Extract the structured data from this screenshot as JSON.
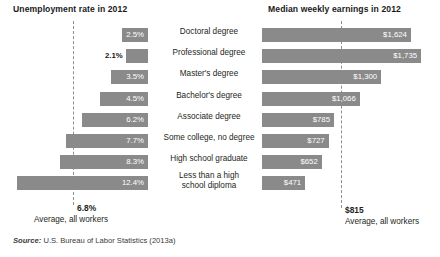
{
  "chart_data": {
    "type": "bar",
    "orientation": "horizontal",
    "layout": "paired-butterfly",
    "grid": false,
    "legend": null,
    "categories": [
      "Doctoral degree",
      "Professional degree",
      "Master's degree",
      "Bachelor's degree",
      "Associate degree",
      "Some college, no degree",
      "High school graduate",
      "Less than a high school diploma"
    ],
    "panels": [
      {
        "id": "unemployment",
        "title": "Unemployment rate in 2012",
        "xlabel": "",
        "ylabel": "",
        "unit": "percent",
        "direction": "left",
        "values": [
          2.5,
          2.1,
          3.5,
          4.5,
          6.2,
          7.7,
          8.3,
          12.4
        ],
        "value_labels": [
          "2.5%",
          "2.1%",
          "3.5%",
          "4.5%",
          "6.2%",
          "7.7%",
          "8.3%",
          "12.4%"
        ],
        "label_placement": [
          "inside",
          "outside",
          "inside",
          "inside",
          "inside",
          "inside",
          "inside",
          "inside"
        ],
        "reference_line": {
          "value": 6.8,
          "label": "6.8%",
          "caption": "Average, all workers"
        },
        "xlim": [
          0,
          14
        ]
      },
      {
        "id": "earnings",
        "title": "Median weekly earnings in 2012",
        "xlabel": "",
        "ylabel": "",
        "unit": "US dollars per week",
        "direction": "right",
        "values": [
          1624,
          1735,
          1300,
          1066,
          785,
          727,
          652,
          471
        ],
        "value_labels": [
          "$1,624",
          "$1,735",
          "$1,300",
          "$1,066",
          "$785",
          "$727",
          "$652",
          "$471"
        ],
        "label_placement": [
          "inside",
          "inside",
          "inside",
          "inside",
          "inside",
          "inside",
          "inside",
          "inside"
        ],
        "reference_line": {
          "value": 815,
          "label": "$815",
          "caption": "Average, all workers"
        },
        "xlim": [
          0,
          1900
        ]
      }
    ],
    "colors": {
      "bar": "#8a8a8a",
      "bar_label": "#ffffff",
      "text": "#231f20",
      "reference_line": "#8f8f8f"
    }
  },
  "left_panel": {
    "title": "Unemployment rate in 2012",
    "rows": [
      {
        "label": "2.5%"
      },
      {
        "label": "2.1%"
      },
      {
        "label": "3.5%"
      },
      {
        "label": "4.5%"
      },
      {
        "label": "6.2%"
      },
      {
        "label": "7.7%"
      },
      {
        "label": "8.3%"
      },
      {
        "label": "12.4%"
      }
    ],
    "average_value": "6.8%",
    "average_caption": "Average, all workers"
  },
  "right_panel": {
    "title": "Median weekly earnings in 2012",
    "rows": [
      {
        "label": "$1,624"
      },
      {
        "label": "$1,735"
      },
      {
        "label": "$1,300"
      },
      {
        "label": "$1,066"
      },
      {
        "label": "$785"
      },
      {
        "label": "$727"
      },
      {
        "label": "$652"
      },
      {
        "label": "$471"
      }
    ],
    "average_value": "$815",
    "average_caption": "Average, all workers"
  },
  "categories": [
    {
      "line1": "Doctoral degree",
      "line2": ""
    },
    {
      "line1": "Professional degree",
      "line2": ""
    },
    {
      "line1": "Master's degree",
      "line2": ""
    },
    {
      "line1": "Bachelor's degree",
      "line2": ""
    },
    {
      "line1": "Associate degree",
      "line2": ""
    },
    {
      "line1": "Some college, no degree",
      "line2": ""
    },
    {
      "line1": "High school graduate",
      "line2": ""
    },
    {
      "line1": "Less than a high school diploma",
      "line2": ""
    }
  ],
  "source": {
    "prefix": "Source:",
    "text": "U.S. Bureau of Labor Statistics (2013a)"
  }
}
